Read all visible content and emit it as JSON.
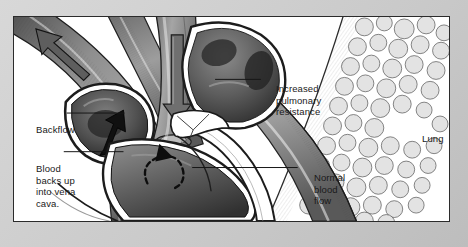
{
  "figure": {
    "type": "medical-illustration",
    "style": "grayscale pen-and-ink anatomical drawing",
    "background_color": "#ffffff",
    "mat_color": "#cccccc",
    "ink_color": "#1a1a1a",
    "vessel_fill": "#8c8c8c",
    "chamber_dark": "#4a4a4a",
    "arrow_color": "#6e6e6e"
  },
  "labels": {
    "backflow": "Backflow",
    "vena_cava": "Blood\nbacks up\ninto vena\ncava.",
    "increased_resistance": "Increased\npulmonary\nresistance",
    "normal_flow": "Normal\nblood\nflow",
    "lung": "Lung"
  },
  "anatomy": {
    "structures": [
      "superior vena cava",
      "inferior vena cava",
      "right atrium",
      "right ventricle",
      "pulmonary artery",
      "pulmonary valve",
      "lung alveoli"
    ]
  },
  "arrows": [
    {
      "name": "backflow-arrow-vena-cava-upper",
      "direction": "up-left",
      "style": "solid-thick-gray",
      "meaning": "backflow into superior vena cava"
    },
    {
      "name": "backflow-arrow-vena-cava-lower",
      "direction": "down",
      "style": "solid-thick-gray",
      "meaning": "blood backs up into inferior vena cava"
    },
    {
      "name": "backflow-arrow-atrium",
      "direction": "up-right",
      "style": "solid-black",
      "meaning": "regurgitant flow into right atrium"
    },
    {
      "name": "pulmonary-artery-arrow",
      "direction": "down",
      "style": "solid-thick-gray",
      "meaning": "increased pulmonary resistance opposing outflow"
    },
    {
      "name": "ventricle-swirl-arrow",
      "direction": "counterclockwise",
      "style": "dashed-black",
      "meaning": "turbulent residual volume in right ventricle"
    }
  ]
}
